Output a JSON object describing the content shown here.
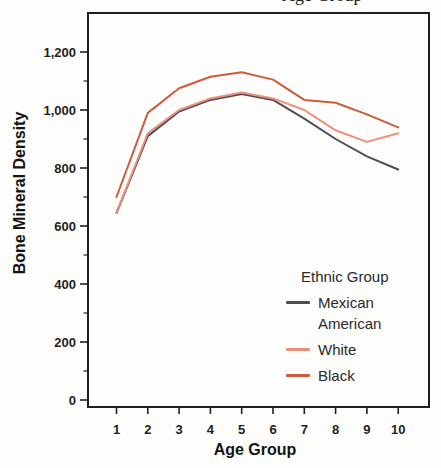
{
  "caption_fragment": "Age Group",
  "chart_data": {
    "type": "line",
    "title": "",
    "xlabel": "Age Group",
    "ylabel": "Bone Mineral Density",
    "x": [
      1,
      2,
      3,
      4,
      5,
      6,
      7,
      8,
      9,
      10
    ],
    "xtick_labels": [
      "1",
      "2",
      "3",
      "4",
      "5",
      "6",
      "7",
      "8",
      "9",
      "10"
    ],
    "ytick_values": [
      0,
      200,
      400,
      600,
      800,
      1000,
      1200
    ],
    "ytick_labels": [
      "0",
      "200",
      "400",
      "600",
      "800",
      "1,000",
      "1,200"
    ],
    "yminor_values": [
      100,
      300,
      500,
      700,
      900,
      1100
    ],
    "ylim": [
      0,
      1200
    ],
    "grid": "off",
    "axis_color": "#1f1f1f",
    "series": [
      {
        "name": "Mexican American",
        "color": "#4e4f54",
        "values": [
          645,
          910,
          995,
          1035,
          1055,
          1035,
          970,
          900,
          840,
          795
        ]
      },
      {
        "name": "White",
        "color": "#ed8f7d",
        "values": [
          645,
          920,
          1000,
          1040,
          1060,
          1040,
          1000,
          930,
          890,
          920
        ]
      },
      {
        "name": "Black",
        "color": "#cd5b3c",
        "values": [
          700,
          990,
          1075,
          1115,
          1130,
          1105,
          1035,
          1025,
          985,
          940
        ]
      }
    ],
    "legend": {
      "title": "Ethnic Group",
      "position": "inside-bottom-right"
    }
  }
}
